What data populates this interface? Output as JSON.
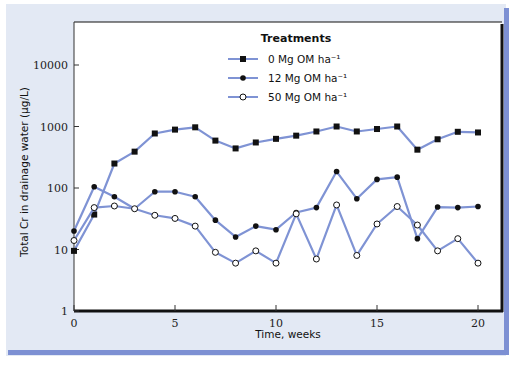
{
  "chart_data": {
    "type": "line",
    "title": "",
    "xlabel": "Time, weeks",
    "ylabel": "Total Cr in drainage water (μg/L)",
    "yscale": "log",
    "xlim": [
      0,
      20
    ],
    "ylim": [
      1,
      50000
    ],
    "x_ticks": [
      0,
      5,
      10,
      15,
      20
    ],
    "x_tick_labels": [
      "0",
      "5",
      "10",
      "15",
      "20"
    ],
    "y_ticks": [
      1,
      10,
      100,
      1000,
      10000
    ],
    "y_tick_labels": [
      "1",
      "10",
      "100",
      "1000",
      "10000"
    ],
    "grid": false,
    "legend_position": "upper center",
    "legend_title": "Treatments",
    "x": [
      0,
      1,
      2,
      3,
      4,
      5,
      6,
      7,
      8,
      9,
      10,
      11,
      12,
      13,
      14,
      15,
      16,
      17,
      18,
      19,
      20
    ],
    "series": [
      {
        "name": "0 Mg OM ha⁻¹",
        "marker": "square-filled",
        "values": [
          9.5,
          37,
          250,
          390,
          770,
          890,
          970,
          590,
          440,
          550,
          630,
          710,
          830,
          1000,
          830,
          910,
          1000,
          420,
          620,
          820,
          800
        ]
      },
      {
        "name": "12 Mg OM ha⁻¹",
        "marker": "circle-filled",
        "values": [
          20,
          105,
          72,
          46,
          87,
          87,
          72,
          30,
          16,
          24,
          21,
          40,
          48,
          185,
          67,
          138,
          150,
          15,
          49,
          48,
          50
        ]
      },
      {
        "name": "50 Mg OM ha⁻¹",
        "marker": "circle-open",
        "values": [
          14,
          48,
          51,
          46,
          36,
          32,
          24,
          9,
          6,
          9.5,
          6,
          38,
          7,
          53,
          8,
          26,
          50,
          25,
          9.5,
          15,
          6
        ]
      }
    ],
    "colors": {
      "line": "#7f93d4",
      "marker": "#111111",
      "panel": "#e3e9f4",
      "frame": "#7d90d3"
    }
  }
}
